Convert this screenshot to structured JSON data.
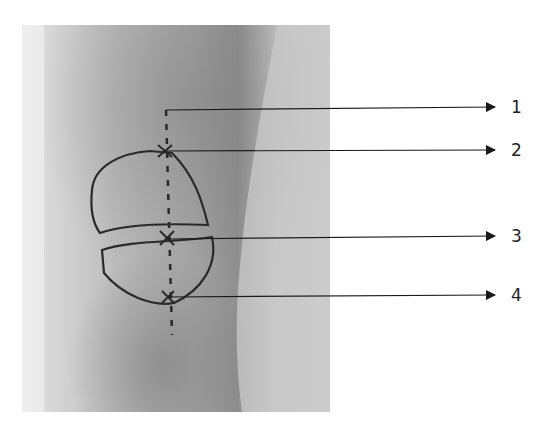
{
  "figure": {
    "colors": {
      "background": "#ffffff",
      "arrow": "#1a1a1a",
      "marker": "#2a2a2a"
    }
  },
  "callouts": [
    {
      "label": "1",
      "from": [
        166,
        110
      ],
      "to": [
        495,
        107
      ]
    },
    {
      "label": "2",
      "from": [
        164,
        151
      ],
      "to": [
        495,
        150
      ]
    },
    {
      "label": "3",
      "from": [
        166,
        239
      ],
      "to": [
        495,
        236
      ]
    },
    {
      "label": "4",
      "from": [
        168,
        297
      ],
      "to": [
        495,
        295
      ]
    }
  ]
}
